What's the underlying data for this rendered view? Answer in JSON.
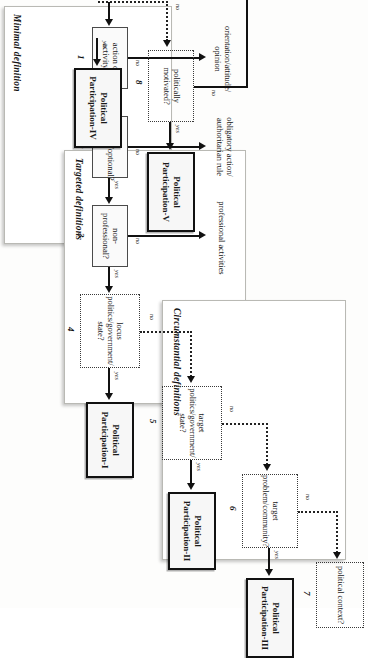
{
  "figure": {
    "type": "flowchart",
    "orientation": "rotated-90"
  },
  "groups": [
    {
      "id": "minimal",
      "label": "Minimal definition"
    },
    {
      "id": "targeted",
      "label": "Targeted definitions"
    },
    {
      "id": "circumstantial",
      "label": "Circumstantial definitions"
    }
  ],
  "nodes": [
    {
      "num": "1",
      "text": "action or activity?",
      "style": "solid"
    },
    {
      "num": "2",
      "text": "voluntary/optional?",
      "style": "solid"
    },
    {
      "num": "3",
      "text": "non-professional?",
      "style": "solid"
    },
    {
      "num": "4",
      "text": "locus\npolitics/government/\nstate?",
      "style": "dotted"
    },
    {
      "num": "5",
      "text": "target\npolitics/government/\nstate?",
      "style": "dotted"
    },
    {
      "num": "6",
      "text": "target\nproblem/community?",
      "style": "dotted"
    },
    {
      "num": "7",
      "text": "political context?",
      "style": "dotted"
    },
    {
      "num": "8",
      "text": "politically motivated?",
      "style": "dotted"
    }
  ],
  "outcomes": [
    {
      "id": "pp1",
      "label": "Political\nParticipation-I"
    },
    {
      "id": "pp2",
      "label": "Political\nParticipation-II"
    },
    {
      "id": "pp3",
      "label": "Political\nParticipation-III"
    },
    {
      "id": "pp4",
      "label": "Political\nParticipation-IV"
    },
    {
      "id": "pp5",
      "label": "Political\nParticipation-V"
    }
  ],
  "terminals": [
    {
      "id": "t1",
      "text": "orientation/attitude/\nopinion"
    },
    {
      "id": "t2",
      "text": "obligatory action/\nauthoritarian rule"
    },
    {
      "id": "t3",
      "text": "professional activities"
    },
    {
      "id": "t4",
      "text": "non-political activities"
    }
  ],
  "edges": {
    "yes": "yes",
    "no": "no"
  }
}
